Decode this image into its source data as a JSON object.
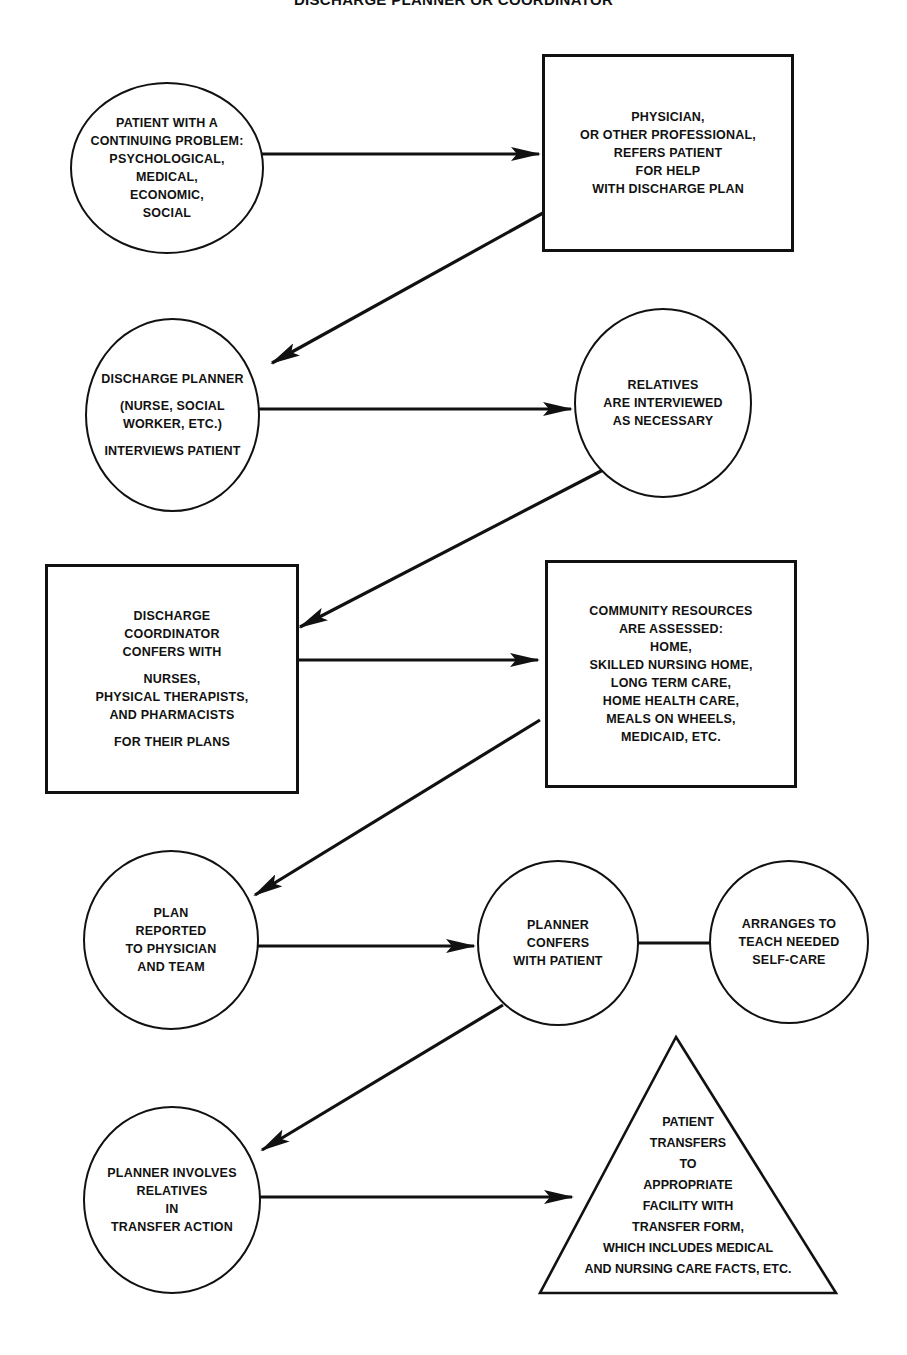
{
  "title": "DISCHARGE PLANNER OR COORDINATOR",
  "nodes": {
    "patient_problem": {
      "shape": "circle",
      "lines": [
        "PATIENT WITH A",
        "CONTINUING PROBLEM:",
        "PSYCHOLOGICAL,",
        "MEDICAL,",
        "ECONOMIC,",
        "SOCIAL"
      ]
    },
    "physician_refers": {
      "shape": "box",
      "lines": [
        "PHYSICIAN,",
        "OR OTHER PROFESSIONAL,",
        "REFERS PATIENT",
        "FOR HELP",
        "WITH DISCHARGE PLAN"
      ]
    },
    "planner_interviews": {
      "shape": "circle",
      "lines": [
        "DISCHARGE PLANNER",
        "(NURSE, SOCIAL",
        "WORKER, ETC.)",
        "INTERVIEWS PATIENT"
      ]
    },
    "relatives_interviewed": {
      "shape": "circle",
      "lines": [
        "RELATIVES",
        "ARE INTERVIEWED",
        "AS NECESSARY"
      ]
    },
    "coordinator_confers": {
      "shape": "box",
      "lines": [
        "DISCHARGE",
        "COORDINATOR",
        "CONFERS WITH",
        "NURSES,",
        "PHYSICAL THERAPISTS,",
        "AND PHARMACISTS",
        "FOR THEIR PLANS"
      ]
    },
    "community_resources": {
      "shape": "box",
      "lines": [
        "COMMUNITY RESOURCES",
        "ARE ASSESSED:",
        "HOME,",
        "SKILLED NURSING HOME,",
        "LONG TERM CARE,",
        "HOME HEALTH CARE,",
        "MEALS ON WHEELS,",
        "MEDICAID, ETC."
      ]
    },
    "plan_reported": {
      "shape": "circle",
      "lines": [
        "PLAN",
        "REPORTED",
        "TO PHYSICIAN",
        "AND TEAM"
      ]
    },
    "planner_confers": {
      "shape": "circle",
      "lines": [
        "PLANNER",
        "CONFERS",
        "WITH PATIENT"
      ]
    },
    "teach_selfcare": {
      "shape": "circle",
      "lines": [
        "ARRANGES TO",
        "TEACH NEEDED",
        "SELF-CARE"
      ]
    },
    "involves_relatives": {
      "shape": "circle",
      "lines": [
        "PLANNER INVOLVES",
        "RELATIVES",
        "IN",
        "TRANSFER ACTION"
      ]
    },
    "patient_transfers": {
      "shape": "triangle",
      "lines": [
        "PATIENT",
        "TRANSFERS",
        "TO",
        "APPROPRIATE",
        "FACILITY WITH",
        "TRANSFER FORM,",
        "WHICH INCLUDES MEDICAL",
        "AND NURSING CARE FACTS, ETC."
      ]
    }
  },
  "edges": [
    {
      "from": "patient_problem",
      "to": "physician_refers",
      "arrow": true
    },
    {
      "from": "physician_refers",
      "to": "planner_interviews",
      "arrow": true
    },
    {
      "from": "planner_interviews",
      "to": "relatives_interviewed",
      "arrow": true
    },
    {
      "from": "relatives_interviewed",
      "to": "coordinator_confers",
      "arrow": true
    },
    {
      "from": "coordinator_confers",
      "to": "community_resources",
      "arrow": true
    },
    {
      "from": "community_resources",
      "to": "plan_reported",
      "arrow": true
    },
    {
      "from": "plan_reported",
      "to": "planner_confers",
      "arrow": true
    },
    {
      "from": "planner_confers",
      "to": "teach_selfcare",
      "arrow": false
    },
    {
      "from": "planner_confers",
      "to": "involves_relatives",
      "arrow": true
    },
    {
      "from": "involves_relatives",
      "to": "patient_transfers",
      "arrow": true
    }
  ],
  "colors": {
    "ink": "#111111",
    "paper": "#ffffff"
  }
}
